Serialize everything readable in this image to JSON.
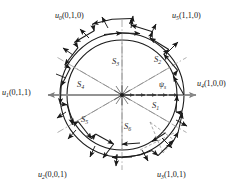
{
  "figure": {
    "type": "space-vector-hexagon-diagram",
    "center": {
      "x": 122,
      "y": 95
    },
    "outer_radius": 62,
    "inner_radius": 55,
    "colors": {
      "stroke": "#1a1a1a",
      "axis": "#8a8a8a",
      "dashdot": "#9a9a9a",
      "sector_line": "#6e6e6e",
      "background": "#ffffff"
    },
    "vectors": [
      {
        "id": "u0",
        "name": "u",
        "index": "0",
        "bits": "(0,1,0)",
        "label": "u0(0,1,0)",
        "angle_deg": 120,
        "pos": {
          "x": 55,
          "y": 11
        }
      },
      {
        "id": "u5",
        "name": "u",
        "index": "5",
        "bits": "(1,1,0)",
        "label": "u5(1,1,0)",
        "angle_deg": 60,
        "pos": {
          "x": 172,
          "y": 11
        }
      },
      {
        "id": "u1",
        "name": "u",
        "index": "1",
        "bits": "(0,1,1)",
        "label": "u1(0,1,1)",
        "angle_deg": 180,
        "pos": {
          "x": 2,
          "y": 88
        }
      },
      {
        "id": "u4",
        "name": "u",
        "index": "4",
        "bits": "(1,0,0)",
        "label": "u4(1,0,0)",
        "angle_deg": 0,
        "pos": {
          "x": 198,
          "y": 79
        }
      },
      {
        "id": "u2",
        "name": "u",
        "index": "2",
        "bits": "(0,0,1)",
        "label": "u2(0,0,1)",
        "angle_deg": 240,
        "pos": {
          "x": 38,
          "y": 171
        }
      },
      {
        "id": "u3",
        "name": "u",
        "index": "3",
        "bits": "(1,0,1)",
        "label": "u3(1,0,1)",
        "angle_deg": 300,
        "pos": {
          "x": 157,
          "y": 171
        }
      }
    ],
    "sectors": [
      {
        "id": "S1",
        "name": "S",
        "index": "1",
        "label": "S1",
        "pos": {
          "x": 152,
          "y": 104
        }
      },
      {
        "id": "S2",
        "name": "S",
        "index": "2",
        "label": "S2",
        "pos": {
          "x": 154,
          "y": 58
        }
      },
      {
        "id": "S3",
        "name": "S",
        "index": "3",
        "label": "S3",
        "pos": {
          "x": 113,
          "y": 60
        }
      },
      {
        "id": "S4",
        "name": "S",
        "index": "4",
        "label": "S4",
        "pos": {
          "x": 78,
          "y": 83
        }
      },
      {
        "id": "S5",
        "name": "S",
        "index": "5",
        "label": "S5",
        "pos": {
          "x": 82,
          "y": 118
        }
      },
      {
        "id": "S6",
        "name": "S",
        "index": "6",
        "label": "S6",
        "pos": {
          "x": 124,
          "y": 125
        }
      }
    ],
    "flux": {
      "id": "psi_s",
      "symbol": "ψ",
      "index": "s",
      "label": "ψs",
      "pos": {
        "x": 160,
        "y": 82
      }
    },
    "axes": {
      "horizontal": {
        "from_deg": 180,
        "to_deg": 0,
        "style": "solid-gray-double-arrow"
      },
      "vertical": {
        "style": "dash-dot"
      },
      "sector_dividers_deg": [
        0,
        60,
        120,
        180,
        240,
        300
      ]
    },
    "trajectory": {
      "description": "zig-zag switching trajectory of stator flux between inner and outer circle",
      "segments": 24,
      "arrowheads": true
    }
  }
}
